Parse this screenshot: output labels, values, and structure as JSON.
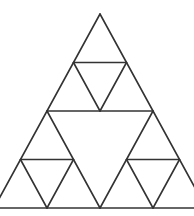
{
  "diagram": {
    "type": "sierpinski-triangle",
    "levels": 2,
    "stroke_color": "#333333",
    "background": "#ffffff",
    "outer_triangle": {
      "apex": [
        100,
        14
      ],
      "left": [
        -6,
        208
      ],
      "right": [
        206,
        208
      ]
    },
    "lines": [
      {
        "name": "outer-left-edge",
        "x1": 100,
        "y1": 14,
        "x2": -6,
        "y2": 208
      },
      {
        "name": "outer-right-edge",
        "x1": 100,
        "y1": 14,
        "x2": 206,
        "y2": 208
      },
      {
        "name": "baseline",
        "x1": -6,
        "y1": 208,
        "x2": 206,
        "y2": 208
      },
      {
        "name": "mid-horizontal",
        "x1": 47,
        "y1": 111,
        "x2": 153,
        "y2": 111
      },
      {
        "name": "center-inverted-left",
        "x1": 47,
        "y1": 111,
        "x2": 100,
        "y2": 208
      },
      {
        "name": "center-inverted-right",
        "x1": 153,
        "y1": 111,
        "x2": 100,
        "y2": 208
      },
      {
        "name": "top-sub-horizontal",
        "x1": 73.5,
        "y1": 62.5,
        "x2": 126.5,
        "y2": 62.5
      },
      {
        "name": "top-sub-inverted-left",
        "x1": 73.5,
        "y1": 62.5,
        "x2": 100,
        "y2": 111
      },
      {
        "name": "top-sub-inverted-right",
        "x1": 126.5,
        "y1": 62.5,
        "x2": 100,
        "y2": 111
      },
      {
        "name": "left-sub-horizontal",
        "x1": 20.5,
        "y1": 159.5,
        "x2": 73.5,
        "y2": 159.5
      },
      {
        "name": "left-sub-inverted-left",
        "x1": 20.5,
        "y1": 159.5,
        "x2": 47,
        "y2": 208
      },
      {
        "name": "left-sub-inverted-right",
        "x1": 73.5,
        "y1": 159.5,
        "x2": 47,
        "y2": 208
      },
      {
        "name": "right-sub-horizontal",
        "x1": 126.5,
        "y1": 159.5,
        "x2": 179.5,
        "y2": 159.5
      },
      {
        "name": "right-sub-inverted-left",
        "x1": 126.5,
        "y1": 159.5,
        "x2": 153,
        "y2": 208
      },
      {
        "name": "right-sub-inverted-right",
        "x1": 179.5,
        "y1": 159.5,
        "x2": 153,
        "y2": 208
      }
    ]
  }
}
